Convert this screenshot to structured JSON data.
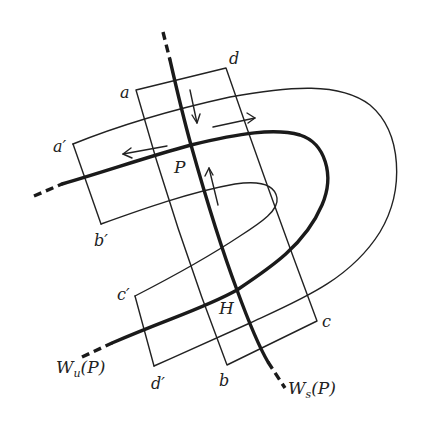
{
  "figure": {
    "colors": {
      "ink": "#1a1a1a",
      "background": "#ffffff"
    },
    "labels": {
      "a": "a",
      "b": "b",
      "c": "c",
      "d": "d",
      "a_prime": "a′",
      "b_prime": "b′",
      "c_prime": "c′",
      "d_prime": "d′",
      "P": "P",
      "H": "H",
      "Wu_W": "W",
      "Wu_sub": "u",
      "Wu_arg": "(P)",
      "Ws_W": "W",
      "Ws_sub": "s",
      "Ws_arg": "(P)"
    },
    "curves": [
      {
        "name": "stable-manifold",
        "label": "W_s(P)",
        "style": "thick"
      },
      {
        "name": "unstable-manifold",
        "label": "W_u(P)",
        "style": "thick"
      },
      {
        "name": "rectangle-abcd",
        "style": "thin"
      },
      {
        "name": "horseshoe-image",
        "style": "thin"
      }
    ],
    "arrows": [
      {
        "name": "contract-arrow-down",
        "direction": "down"
      },
      {
        "name": "contract-arrow-up",
        "direction": "up"
      },
      {
        "name": "expand-arrow-left",
        "direction": "left"
      },
      {
        "name": "expand-arrow-right",
        "direction": "right"
      }
    ]
  }
}
